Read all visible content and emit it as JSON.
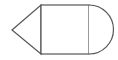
{
  "diagram": {
    "stroke_color": "#555555",
    "fill_color": "#ffffff",
    "shapes": [
      {
        "type": "triangle",
        "points": [
          [
            12,
            30
          ],
          [
            41,
            5
          ],
          [
            41,
            54
          ]
        ]
      },
      {
        "type": "square",
        "x": 41,
        "y": 5,
        "width": 48,
        "height": 49
      },
      {
        "type": "semicircle",
        "cx": 89,
        "cy": 29.5,
        "r": 24.5,
        "direction": "right"
      }
    ]
  }
}
